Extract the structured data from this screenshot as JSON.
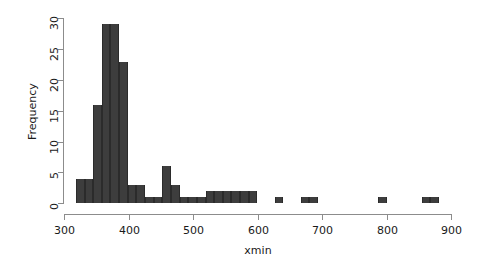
{
  "chart_data": {
    "type": "bar",
    "title": "",
    "subtitle": "",
    "xlabel": "xmin",
    "ylabel": "Frequency",
    "xlim": [
      300,
      900
    ],
    "ylim": [
      0,
      30
    ],
    "xticks": [
      300,
      400,
      500,
      600,
      700,
      800,
      900
    ],
    "xtick_labels": [
      "300",
      "400",
      "500",
      "600",
      "700",
      "800",
      "900"
    ],
    "yticks": [
      0,
      5,
      10,
      15,
      20,
      25,
      30
    ],
    "ytick_labels": [
      "0",
      "5",
      "10",
      "15",
      "20",
      "25",
      "30"
    ],
    "grid": false,
    "legend": false,
    "legend_position": "none",
    "bin_width": 13.4,
    "bin_start": 318,
    "bar_color": "#3d3d3d",
    "axis_color": "#8c8c8c",
    "bin_edges": [
      318,
      331.4,
      344.8,
      358.2,
      371.6,
      385,
      398.4,
      411.8,
      425.2,
      438.6,
      452,
      465.4,
      478.8,
      492.2,
      505.6,
      519,
      532.4,
      545.8,
      559.2,
      572.6,
      586,
      599.4,
      612.8,
      626.2,
      639.6,
      653,
      666.4,
      679.8,
      693.2,
      706.6,
      720,
      733.4,
      746.8,
      760.2,
      773.6,
      787,
      800.4,
      813.8,
      827.2,
      840.6,
      854,
      867.4,
      880.8
    ],
    "categories": [
      "318-331",
      "331-345",
      "345-358",
      "358-372",
      "372-385",
      "385-398",
      "398-412",
      "412-425",
      "425-439",
      "439-452",
      "452-465",
      "465-479",
      "479-492",
      "492-506",
      "506-519",
      "519-532",
      "532-546",
      "546-559",
      "559-573",
      "573-586",
      "586-599",
      "599-613",
      "613-626",
      "626-640",
      "640-653",
      "653-666",
      "666-679",
      "679-693",
      "693-707",
      "707-720",
      "720-733",
      "733-747",
      "747-760",
      "760-774",
      "774-787",
      "787-800",
      "800-814",
      "814-827",
      "827-841",
      "841-854",
      "854-867",
      "867-881"
    ],
    "values": [
      4,
      4,
      16,
      29,
      29,
      23,
      3,
      3,
      1,
      1,
      6,
      3,
      1,
      1,
      1,
      2,
      2,
      2,
      2,
      2,
      2,
      0,
      0,
      1,
      0,
      0,
      1,
      1,
      0,
      0,
      0,
      0,
      0,
      0,
      0,
      1,
      0,
      0,
      0,
      0,
      1,
      1
    ]
  }
}
